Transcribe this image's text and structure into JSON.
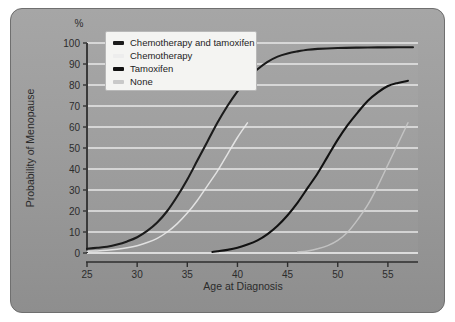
{
  "figure": {
    "background_color": "#9a9a9a",
    "border_color": "#6f6f6f"
  },
  "axis": {
    "y_unit_label": "%",
    "y_title": "Probability of Menopause",
    "x_title": "Age at Diagnosis",
    "y_ticks": [
      "0",
      "10",
      "20",
      "30",
      "40",
      "50",
      "60",
      "70",
      "80",
      "90",
      "100"
    ],
    "x_ticks": [
      "25",
      "30",
      "35",
      "40",
      "45",
      "50",
      "55"
    ]
  },
  "legend": {
    "items": [
      {
        "label": "Chemotherapy and tamoxifen",
        "color": "#1b1b1b"
      },
      {
        "label": "Chemotherapy",
        "color": "#ededed"
      },
      {
        "label": "Tamoxifen",
        "color": "#121212"
      },
      {
        "label": "None",
        "color": "#c9c9c9"
      }
    ]
  },
  "chart_data": {
    "type": "line",
    "title": "",
    "xlabel": "Age at Diagnosis",
    "ylabel": "Probability of Menopause",
    "y_unit": "%",
    "xlim": [
      25,
      58
    ],
    "ylim": [
      0,
      100
    ],
    "grid": true,
    "grid_color": "#f0f0f0",
    "legend_position": "top-left",
    "series": [
      {
        "name": "Chemotherapy and tamoxifen",
        "color": "#1b1b1b",
        "points": [
          [
            25,
            2
          ],
          [
            26,
            2.5
          ],
          [
            27,
            3
          ],
          [
            28,
            4
          ],
          [
            29,
            5.5
          ],
          [
            30,
            7.5
          ],
          [
            31,
            10.5
          ],
          [
            32,
            14.5
          ],
          [
            33,
            20
          ],
          [
            34,
            27
          ],
          [
            35,
            35
          ],
          [
            36,
            44
          ],
          [
            37,
            53
          ],
          [
            38,
            62
          ],
          [
            39,
            70
          ],
          [
            40,
            77
          ],
          [
            41,
            83
          ],
          [
            42,
            87.5
          ],
          [
            43,
            91
          ],
          [
            44,
            93.5
          ],
          [
            45,
            95
          ],
          [
            46,
            96
          ],
          [
            47,
            96.8
          ],
          [
            48,
            97.2
          ],
          [
            50,
            97.6
          ],
          [
            52,
            97.8
          ],
          [
            54,
            97.9
          ],
          [
            56,
            98
          ],
          [
            57.5,
            98
          ]
        ]
      },
      {
        "name": "Chemotherapy",
        "color": "#ededed",
        "points": [
          [
            25,
            0.8
          ],
          [
            26,
            1
          ],
          [
            27,
            1.3
          ],
          [
            28,
            1.8
          ],
          [
            29,
            2.5
          ],
          [
            30,
            3.5
          ],
          [
            31,
            5
          ],
          [
            32,
            7
          ],
          [
            33,
            10
          ],
          [
            34,
            14
          ],
          [
            35,
            19
          ],
          [
            36,
            25
          ],
          [
            37,
            32
          ],
          [
            38,
            39
          ],
          [
            39,
            47
          ],
          [
            40,
            55
          ],
          [
            41,
            62
          ]
        ]
      },
      {
        "name": "Tamoxifen",
        "color": "#121212",
        "points": [
          [
            37.5,
            0.5
          ],
          [
            38,
            0.8
          ],
          [
            39,
            1.5
          ],
          [
            40,
            2.5
          ],
          [
            41,
            4
          ],
          [
            42,
            6
          ],
          [
            43,
            9
          ],
          [
            44,
            13
          ],
          [
            45,
            18
          ],
          [
            46,
            24
          ],
          [
            47,
            31
          ],
          [
            48,
            38
          ],
          [
            49,
            46
          ],
          [
            50,
            54
          ],
          [
            51,
            61
          ],
          [
            52,
            67
          ],
          [
            53,
            72.5
          ],
          [
            54,
            76.5
          ],
          [
            55,
            79.5
          ],
          [
            56,
            81
          ],
          [
            57,
            82
          ]
        ]
      },
      {
        "name": "None",
        "color": "#c9c9c9",
        "points": [
          [
            46,
            0.5
          ],
          [
            47,
            1
          ],
          [
            48,
            2
          ],
          [
            49,
            3.5
          ],
          [
            50,
            6
          ],
          [
            51,
            10
          ],
          [
            52,
            16
          ],
          [
            53,
            23
          ],
          [
            54,
            32
          ],
          [
            55,
            42
          ],
          [
            56,
            52
          ],
          [
            57,
            62
          ]
        ]
      }
    ]
  }
}
